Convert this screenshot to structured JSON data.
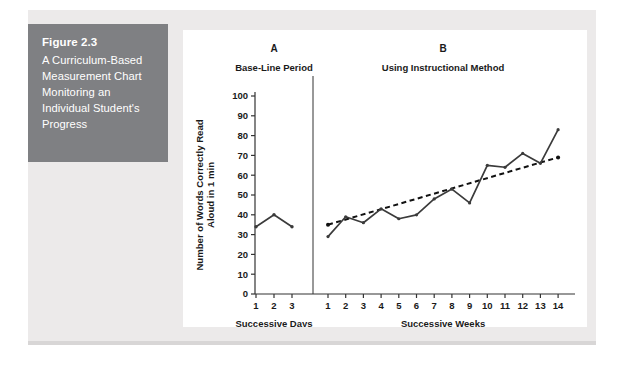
{
  "figure": {
    "number": "Figure 2.3",
    "caption": "A Curriculum-Based Measurement Chart Monitoring an Individual Student's Progress"
  },
  "chart_data": {
    "type": "line",
    "title": "",
    "phases": [
      {
        "letter": "A",
        "label": "Base-Line Period",
        "xlabel": "Successive Days",
        "x": [
          1,
          2,
          3
        ],
        "tick_labels": [
          "1",
          "2",
          "3"
        ],
        "values": [
          34,
          40,
          34
        ]
      },
      {
        "letter": "B",
        "label": "Using Instructional Method",
        "xlabel": "Successive Weeks",
        "x": [
          1,
          2,
          3,
          4,
          5,
          6,
          7,
          8,
          9,
          10,
          11,
          12,
          13,
          14
        ],
        "tick_labels": [
          "1",
          "2",
          "3",
          "4",
          "5",
          "6",
          "7",
          "8",
          "9",
          "10",
          "11",
          "12",
          "13",
          "14"
        ],
        "values": [
          29,
          39,
          36,
          43,
          38,
          40,
          48,
          53,
          46,
          65,
          64,
          71,
          66,
          83
        ],
        "trend_line": {
          "style": "dashed",
          "start_value": 35,
          "end_value": 69
        }
      }
    ],
    "ylabel": "Number of Words Correctly Read Aloud in 1 min",
    "ytick_labels": [
      "0",
      "10",
      "20",
      "30",
      "40",
      "50",
      "60",
      "70",
      "80",
      "90",
      "100"
    ],
    "yticks": [
      0,
      10,
      20,
      30,
      40,
      50,
      60,
      70,
      80,
      90,
      100
    ],
    "ylim": [
      0,
      100
    ],
    "grid": false,
    "legend": "none",
    "series_color": "#3b3b3b",
    "trend_color": "#111111"
  },
  "colors": {
    "caption_background": "#7f8083",
    "caption_text": "#ffffff",
    "panel_background": "#ffffff",
    "page_background": "#eceaea",
    "axis": "#333333"
  }
}
